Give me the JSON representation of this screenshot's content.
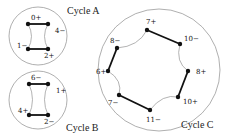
{
  "cycles": [
    {
      "title": "Cycle A",
      "circle": {
        "cx": 38,
        "cy": 36,
        "r": 29
      },
      "title_pos": [
        67,
        14
      ],
      "nodes": [
        {
          "label": "0+",
          "x": 28,
          "y": 24,
          "lx": 31,
          "ly": 20
        },
        {
          "label": "4−",
          "x": 48,
          "y": 24,
          "lx": 55,
          "ly": 33
        },
        {
          "label": "1−",
          "x": 28,
          "y": 49,
          "lx": 17,
          "ly": 48
        },
        {
          "label": "2+",
          "x": 48,
          "y": 49,
          "lx": 44,
          "ly": 58
        }
      ],
      "edges": [
        [
          0,
          1
        ],
        [
          2,
          3
        ]
      ],
      "arcs": [
        [
          0,
          2,
          "in"
        ],
        [
          1,
          3,
          "in"
        ]
      ]
    },
    {
      "title": "Cycle B",
      "circle": {
        "cx": 38,
        "cy": 100,
        "r": 29
      },
      "title_pos": [
        66,
        131
      ],
      "nodes": [
        {
          "label": "6−",
          "x": 29,
          "y": 84,
          "lx": 31,
          "ly": 80
        },
        {
          "label": "1+",
          "x": 48,
          "y": 84,
          "lx": 56,
          "ly": 93
        },
        {
          "label": "4+",
          "x": 29,
          "y": 115,
          "lx": 18,
          "ly": 113
        },
        {
          "label": "2−",
          "x": 48,
          "y": 115,
          "lx": 44,
          "ly": 124
        }
      ],
      "edges": [
        [
          0,
          1
        ],
        [
          2,
          3
        ]
      ],
      "arcs": [
        [
          0,
          2,
          "in"
        ],
        [
          1,
          3,
          "in"
        ]
      ]
    },
    {
      "title": "Cycle C",
      "circle": {
        "cx": 159,
        "cy": 70,
        "r": 61
      },
      "title_pos": [
        181,
        128
      ],
      "nodes": [
        {
          "label": "7+",
          "x": 147,
          "y": 30,
          "lx": 146,
          "ly": 24
        },
        {
          "label": "10−",
          "x": 180,
          "y": 44,
          "lx": 184,
          "ly": 41
        },
        {
          "label": "8+",
          "x": 188,
          "y": 71,
          "lx": 196,
          "ly": 74
        },
        {
          "label": "10+",
          "x": 178,
          "y": 97,
          "lx": 183,
          "ly": 104
        },
        {
          "label": "11−",
          "x": 150,
          "y": 110,
          "lx": 146,
          "ly": 122
        },
        {
          "label": "7−",
          "x": 119,
          "y": 95,
          "lx": 108,
          "ly": 105
        },
        {
          "label": "6+",
          "x": 108,
          "y": 71,
          "lx": 96,
          "ly": 74
        },
        {
          "label": "8−",
          "x": 117,
          "y": 48,
          "lx": 110,
          "ly": 43
        }
      ],
      "edges": [
        [
          0,
          1
        ],
        [
          2,
          3
        ],
        [
          4,
          5
        ],
        [
          6,
          7
        ]
      ],
      "arcs": [
        [
          1,
          2
        ],
        [
          3,
          4
        ],
        [
          5,
          6
        ],
        [
          7,
          0
        ]
      ]
    }
  ],
  "colors": {
    "circle": "#9a9a9a",
    "edge": "#111111",
    "arc": "#a0a0a0",
    "node": "#111111"
  }
}
